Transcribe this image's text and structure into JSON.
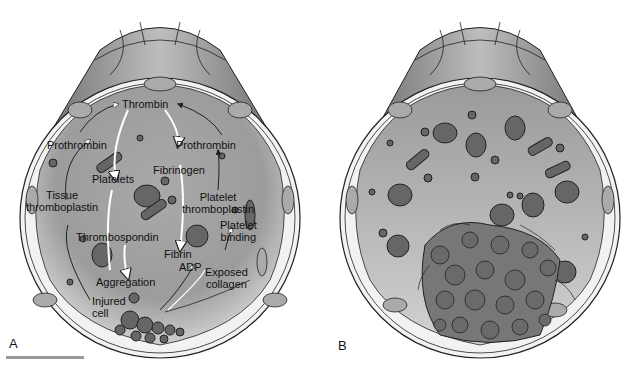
{
  "figure": {
    "panels": [
      {
        "id": "A",
        "label": "A",
        "description": "Blood vessel cross-section showing coagulation pathway at injury site",
        "labels": {
          "thrombin": "Thrombin",
          "prothrombin_left": "Prothrombin",
          "prothrombin_right": "Prothrombin",
          "platelets": "Platelets",
          "fibrinogen": "Fibrinogen",
          "tissue_thromboplastin_1": "Tissue",
          "tissue_thromboplastin_2": "thromboplastin",
          "platelet_thromboplastin_1": "Platelet",
          "platelet_thromboplastin_2": "thromboplastin",
          "platelet_binding_1": "Platelet",
          "platelet_binding_2": "binding",
          "thrombospondin": "Thrombospondin",
          "fibrin": "Fibrin",
          "adp": "ADP",
          "exposed_collagen_1": "Exposed",
          "exposed_collagen_2": "collagen",
          "aggregation": "Aggregation",
          "injured_cell_1": "Injured",
          "injured_cell_2": "cell"
        }
      },
      {
        "id": "B",
        "label": "B",
        "description": "Blood vessel cross-section showing formed thrombus occluding lumen"
      }
    ],
    "colors": {
      "lumen": "#9a9a9a",
      "lumen_light": "#c8c8c8",
      "wall": "#f2f2f2",
      "endothelium_outer": "#8a8a8a",
      "cell_fill": "#777777",
      "outline": "#222222",
      "scale_bar": "#999999"
    }
  }
}
